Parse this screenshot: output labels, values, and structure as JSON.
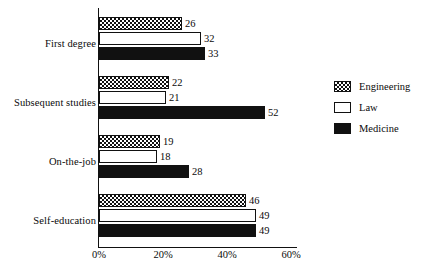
{
  "chart_data": {
    "type": "bar",
    "orientation": "horizontal",
    "title": "",
    "xlabel": "",
    "ylabel": "",
    "categories": [
      "First degree",
      "Subsequent studies",
      "On-the-job",
      "Self-education"
    ],
    "series": [
      {
        "name": "Engineering",
        "values": [
          26,
          22,
          19,
          46
        ],
        "style": "checkered"
      },
      {
        "name": "Law",
        "values": [
          32,
          21,
          18,
          49
        ],
        "style": "white-outline"
      },
      {
        "name": "Medicine",
        "values": [
          33,
          52,
          28,
          49
        ],
        "style": "solid-black"
      }
    ],
    "xlim": [
      0,
      60
    ],
    "xticks": [
      0,
      20,
      40,
      60
    ],
    "xtick_labels": [
      "0%",
      "20%",
      "40%",
      "60%"
    ],
    "grid": false,
    "legend_position": "right",
    "value_labels": true,
    "colors": {
      "ink": "#111111",
      "background": "#ffffff",
      "engineering": "#ffffff",
      "law": "#ffffff",
      "medicine": "#111111"
    }
  },
  "legend": {
    "items": [
      {
        "label": "Engineering",
        "swatch": "checkered-swatch-icon"
      },
      {
        "label": "Law",
        "swatch": "white-swatch-icon"
      },
      {
        "label": "Medicine",
        "swatch": "black-swatch-icon"
      }
    ]
  }
}
